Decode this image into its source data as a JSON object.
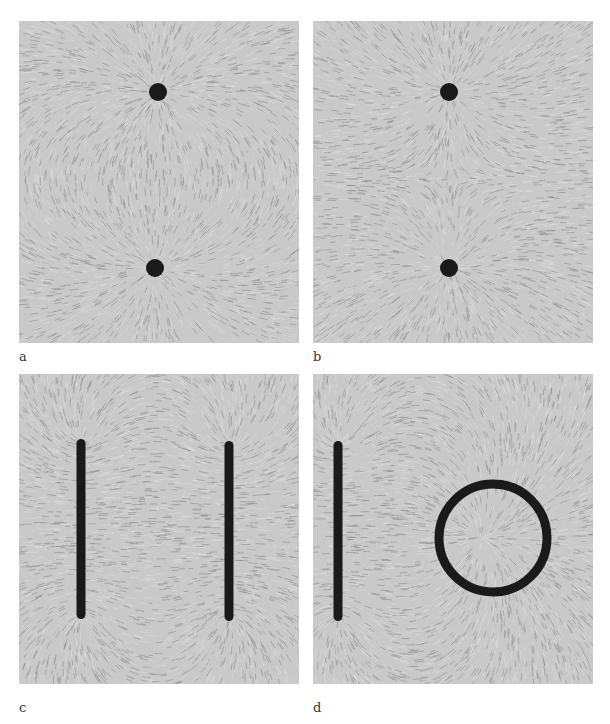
{
  "figure": {
    "panels": [
      {
        "id": "a",
        "label": "a",
        "description": "Field lines between two point electrodes of opposite charge",
        "electrodes": [
          {
            "type": "dot",
            "x": 139,
            "y": 71,
            "r": 9
          },
          {
            "type": "dot",
            "x": 136,
            "y": 247,
            "r": 9
          }
        ]
      },
      {
        "id": "b",
        "label": "b",
        "description": "Field lines between two point electrodes of like charge",
        "electrodes": [
          {
            "type": "dot",
            "x": 136,
            "y": 71,
            "r": 9
          },
          {
            "type": "dot",
            "x": 136,
            "y": 247,
            "r": 9
          }
        ]
      },
      {
        "id": "c",
        "label": "c",
        "description": "Field lines between two parallel plate electrodes",
        "electrodes": [
          {
            "type": "bar",
            "x": 62,
            "y1": 65,
            "y2": 245,
            "w": 9
          },
          {
            "type": "bar",
            "x": 210,
            "y1": 67,
            "y2": 247,
            "w": 9
          }
        ]
      },
      {
        "id": "d",
        "label": "d",
        "description": "Field lines between a plate electrode and a ring electrode",
        "electrodes": [
          {
            "type": "bar",
            "x": 25,
            "y1": 67,
            "y2": 247,
            "w": 9
          },
          {
            "type": "ring",
            "cx": 180,
            "cy": 164,
            "r": 54,
            "w": 9
          }
        ]
      }
    ]
  },
  "colors": {
    "background": "#c9c9c9",
    "lines": "#8a8a8a",
    "electrode": "#1a1a1a"
  }
}
